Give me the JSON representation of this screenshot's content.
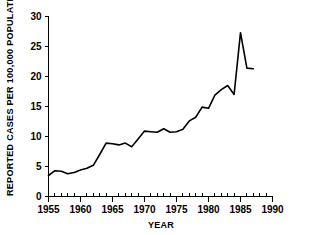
{
  "chart_data": {
    "type": "line",
    "title": "",
    "xlabel": "YEAR",
    "ylabel": "REPORTED CASES PER 100,000 POPULATION",
    "xlim": [
      1955,
      1990
    ],
    "ylim": [
      0,
      30
    ],
    "grid": false,
    "legend": false,
    "x_ticks": [
      1955,
      1960,
      1965,
      1970,
      1975,
      1980,
      1985,
      1990
    ],
    "x_tick_labels": [
      "1955",
      "1960",
      "1965",
      "1970",
      "1975",
      "1980",
      "1985",
      "1990"
    ],
    "x_minor_tick_step": 1,
    "y_ticks": [
      0,
      5,
      10,
      15,
      20,
      25,
      30
    ],
    "y_tick_labels": [
      "0",
      "5",
      "10",
      "15",
      "20",
      "25",
      "30"
    ],
    "series": [
      {
        "name": "Reported cases per 100,000 population",
        "color": "#000000",
        "x": [
          1955,
          1956,
          1957,
          1958,
          1959,
          1960,
          1961,
          1962,
          1963,
          1964,
          1965,
          1966,
          1967,
          1968,
          1969,
          1970,
          1971,
          1972,
          1973,
          1974,
          1975,
          1976,
          1977,
          1978,
          1979,
          1980,
          1981,
          1982,
          1983,
          1984,
          1985,
          1986,
          1987
        ],
        "values": [
          3.5,
          4.3,
          4.2,
          3.8,
          4.0,
          4.4,
          4.7,
          5.2,
          7.0,
          8.9,
          8.8,
          8.6,
          8.9,
          8.3,
          9.6,
          10.9,
          10.8,
          10.7,
          11.3,
          10.7,
          10.8,
          11.2,
          12.6,
          13.2,
          14.9,
          14.7,
          16.9,
          17.8,
          18.5,
          17.0,
          27.3,
          21.4,
          21.3
        ]
      }
    ]
  },
  "axis_titles": {
    "x": "YEAR",
    "y": "REPORTED CASES PER 100,000 POPULATION"
  }
}
